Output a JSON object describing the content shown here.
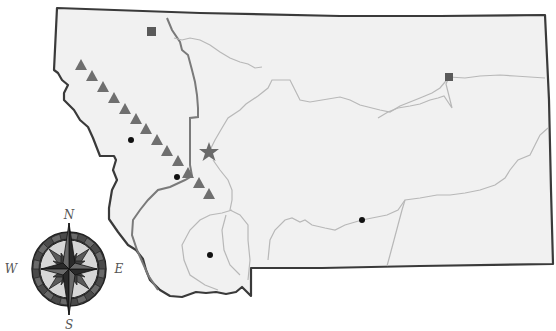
{
  "map": {
    "region": "Montana",
    "colors": {
      "land_fill": "#f1f1f1",
      "state_border": "#3a3a3a",
      "divide_line": "#7a7a7a",
      "river": "#b5b5b5",
      "triangle": "#6f6f6f",
      "square": "#5a5a5a",
      "star": "#6a6a6a",
      "dot": "#111111"
    },
    "markers": {
      "squares": [
        {
          "x": 152,
          "y": 32
        },
        {
          "x": 449,
          "y": 77
        }
      ],
      "star": {
        "x": 209,
        "y": 152
      },
      "triangles": [
        {
          "x": 81,
          "y": 65
        },
        {
          "x": 92,
          "y": 76
        },
        {
          "x": 103,
          "y": 87
        },
        {
          "x": 114,
          "y": 98
        },
        {
          "x": 125,
          "y": 109
        },
        {
          "x": 136,
          "y": 119
        },
        {
          "x": 146,
          "y": 129
        },
        {
          "x": 157,
          "y": 140
        },
        {
          "x": 167,
          "y": 151
        },
        {
          "x": 178,
          "y": 161
        },
        {
          "x": 188,
          "y": 173
        },
        {
          "x": 199,
          "y": 183
        },
        {
          "x": 209,
          "y": 194
        }
      ],
      "dots": [
        {
          "x": 131,
          "y": 140
        },
        {
          "x": 177,
          "y": 177
        },
        {
          "x": 210,
          "y": 255
        },
        {
          "x": 362,
          "y": 220
        }
      ]
    }
  },
  "compass": {
    "north": "N",
    "east": "E",
    "south": "S",
    "west": "W"
  }
}
